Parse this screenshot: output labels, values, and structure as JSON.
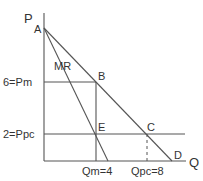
{
  "diagram": {
    "axes": {
      "y_label": "P",
      "x_label": "Q"
    },
    "points": {
      "A": "A",
      "B": "B",
      "C": "C",
      "D": "D",
      "E": "E"
    },
    "curves": {
      "marginal_revenue": "MR",
      "demand": "AD"
    },
    "price_labels": {
      "monopoly_price": "6=Pm",
      "competitive_price": "2=Ppc"
    },
    "quantity_labels": {
      "monopoly_quantity": "Qm=4",
      "competitive_quantity": "Qpc=8"
    },
    "values": {
      "Pm": 6,
      "Ppc": 2,
      "Qm": 4,
      "Qpc": 8
    }
  }
}
